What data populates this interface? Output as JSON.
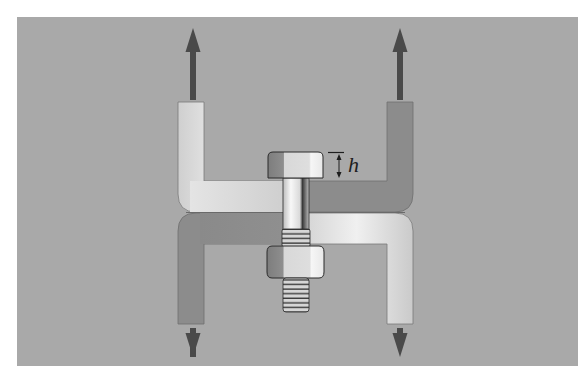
{
  "figure": {
    "background_color": "#ffffff",
    "panel_color": "#a9a9a9",
    "bracket_light": "#e2e2e2",
    "bracket_dark": "#8a8a8a",
    "arrow_color": "#4a4a4a",
    "labels": {
      "dimension_h": "h"
    },
    "elements": [
      {
        "name": "upper-bracket",
        "description": "U-shaped bracket opening upward, pulled up"
      },
      {
        "name": "lower-bracket",
        "description": "U-shaped bracket opening downward, pulled down"
      },
      {
        "name": "bolt",
        "description": "Hex bolt passing through both brackets, head height h"
      },
      {
        "name": "nut",
        "description": "Hex nut on the threaded end of the bolt"
      },
      {
        "name": "force-arrows",
        "description": "Two arrows pointing up, two arrows pointing down"
      }
    ]
  }
}
